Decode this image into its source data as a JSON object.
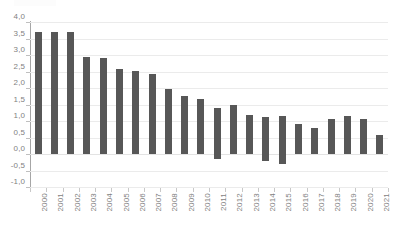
{
  "chart_data": {
    "type": "bar",
    "title": "",
    "subtitle": "",
    "xlabel": "",
    "ylabel": "",
    "categories": [
      "2000",
      "2001",
      "2002",
      "2003",
      "2004",
      "2005",
      "2006",
      "2007",
      "2008",
      "2009",
      "2010",
      "2011",
      "2012",
      "2013",
      "2014",
      "2015",
      "2016",
      "2017",
      "2018",
      "2019",
      "2020",
      "2021"
    ],
    "values": [
      3.7,
      3.7,
      3.7,
      2.93,
      2.9,
      2.58,
      2.52,
      2.43,
      1.97,
      1.75,
      1.68,
      1.38,
      1.48,
      1.17,
      1.13,
      1.14,
      0.9,
      0.79,
      1.05,
      1.15,
      1.05,
      0.57
    ],
    "negative_extents": {
      "2011": -0.15,
      "2014": -0.22,
      "2015": -0.3
    },
    "ylim": [
      -1.0,
      4.0
    ],
    "ytick_step": 0.5,
    "ytick_labels": [
      "4,0",
      "3,5",
      "3,0",
      "2,5",
      "2,0",
      "1,5",
      "1,0",
      "0,5",
      "0,0",
      "-0,5",
      "-1,0"
    ],
    "ytick_values": [
      4.0,
      3.5,
      3.0,
      2.5,
      2.0,
      1.5,
      1.0,
      0.5,
      0.0,
      -0.5,
      -1.0
    ],
    "grid": true,
    "legend": false,
    "legend_position": "none",
    "decimal_separator": ",",
    "colors": {
      "bar": "#575757",
      "gridline": "#ebebeb",
      "axis_line": "#a6a6a6",
      "tick_mark": "#c8c8c8",
      "label_text": "#7f7f7f",
      "background": "#ffffff"
    }
  }
}
